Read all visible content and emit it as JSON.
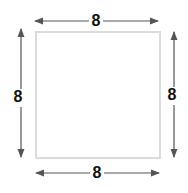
{
  "diagram": {
    "shape": "square",
    "colors": {
      "square_stroke": "#dcdcdc",
      "arrow": "#555555",
      "label": "#111111"
    },
    "labels": {
      "top": "8",
      "bottom": "8",
      "left": "8",
      "right": "8"
    }
  }
}
